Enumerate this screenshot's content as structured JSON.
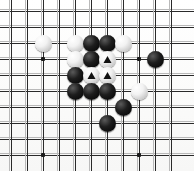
{
  "board": {
    "game": "Go",
    "type": "go-board-diagram",
    "columns": 11,
    "rows": 10,
    "cell_size": 16,
    "origin_x": 11,
    "origin_y": 11,
    "line_color": "#2a2a2a",
    "ghost_line_color": "#b9b9b9",
    "background_color": "#fdfdfc",
    "black_color": "#000000",
    "white_color": "#f2f2f2",
    "marker_color": "#111111"
  },
  "star_points": [
    {
      "name": "star-point-top-left",
      "col": 2,
      "row": 3
    },
    {
      "name": "star-point-top-right",
      "col": 8,
      "row": 3
    },
    {
      "name": "star-point-bottom-left",
      "col": 2,
      "row": 9
    },
    {
      "name": "star-point-bottom-right",
      "col": 8,
      "row": 9
    }
  ],
  "stones": [
    {
      "id": "w1",
      "color": "white",
      "col": 2,
      "row": 2,
      "marker": "none",
      "label": "white-stone"
    },
    {
      "id": "w2",
      "color": "white",
      "col": 4,
      "row": 2,
      "marker": "none",
      "label": "white-stone"
    },
    {
      "id": "b1",
      "color": "black",
      "col": 5,
      "row": 2,
      "marker": "none",
      "label": "black-stone"
    },
    {
      "id": "b2",
      "color": "black",
      "col": 6,
      "row": 2,
      "marker": "none",
      "label": "black-stone"
    },
    {
      "id": "w3",
      "color": "white",
      "col": 7,
      "row": 2,
      "marker": "none",
      "label": "white-stone"
    },
    {
      "id": "w4",
      "color": "white",
      "col": 4,
      "row": 3,
      "marker": "none",
      "label": "white-stone"
    },
    {
      "id": "b3",
      "color": "black",
      "col": 5,
      "row": 3,
      "marker": "none",
      "label": "black-stone"
    },
    {
      "id": "w5",
      "color": "white",
      "col": 6,
      "row": 3,
      "marker": "triangle",
      "label": "white-stone-marked"
    },
    {
      "id": "b4",
      "color": "black",
      "col": 9,
      "row": 3,
      "marker": "none",
      "label": "black-stone"
    },
    {
      "id": "b5",
      "color": "black",
      "col": 4,
      "row": 4,
      "marker": "none",
      "label": "black-stone"
    },
    {
      "id": "w6",
      "color": "white",
      "col": 5,
      "row": 4,
      "marker": "triangle",
      "label": "white-stone-marked"
    },
    {
      "id": "w7",
      "color": "white",
      "col": 6,
      "row": 4,
      "marker": "triangle",
      "label": "white-stone-marked"
    },
    {
      "id": "b6",
      "color": "black",
      "col": 4,
      "row": 5,
      "marker": "none",
      "label": "black-stone"
    },
    {
      "id": "b7",
      "color": "black",
      "col": 5,
      "row": 5,
      "marker": "none",
      "label": "black-stone"
    },
    {
      "id": "b8",
      "color": "black",
      "col": 6,
      "row": 5,
      "marker": "none",
      "label": "black-stone"
    },
    {
      "id": "w8",
      "color": "white",
      "col": 8,
      "row": 5,
      "marker": "none",
      "label": "white-stone"
    },
    {
      "id": "b9",
      "color": "black",
      "col": 7,
      "row": 6,
      "marker": "none",
      "label": "black-stone"
    },
    {
      "id": "b10",
      "color": "black",
      "col": 6,
      "row": 7,
      "marker": "none",
      "label": "black-stone"
    }
  ],
  "counts": {
    "black_stones": 10,
    "white_stones": 8,
    "marked_stones": 3
  }
}
